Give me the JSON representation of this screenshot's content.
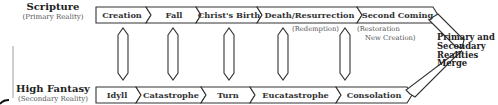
{
  "diagram": {
    "primary": {
      "title": "Scripture",
      "subtitle": "(Primary Reality)",
      "stages": [
        "Creation",
        "Fall",
        "Christ's Birth",
        "Death/Resurrection",
        "Second Coming"
      ],
      "notes": {
        "death_resurrection": "(Redemption)",
        "second_coming_line1": "(Restoration",
        "second_coming_line2": "New Creation)"
      }
    },
    "secondary": {
      "title": "High Fantasy",
      "subtitle": "(Secondary Reality)",
      "stages": [
        "Idyll",
        "Catastrophe",
        "Turn",
        "Eucatastrophe",
        "Consolation"
      ]
    },
    "merge": {
      "line1": "Primary and",
      "line2": "Secondary",
      "line3": "Realities",
      "line4": "Merge"
    },
    "colors": {
      "stroke": "#333333",
      "fill": "#ffffff",
      "text": "#222222",
      "note": "#555555"
    }
  }
}
